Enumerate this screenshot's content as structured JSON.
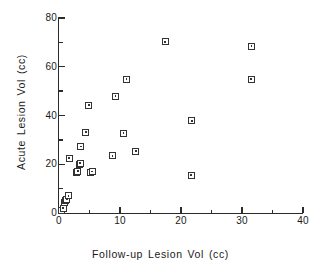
{
  "chart_data": {
    "type": "scatter",
    "title": "",
    "xlabel": "Follow-up Lesion Vol (cc)",
    "ylabel": "Acute Lesion Vol (cc)",
    "xlim": [
      0,
      40
    ],
    "ylim": [
      0,
      80
    ],
    "xticks": [
      0,
      10,
      20,
      30,
      40
    ],
    "xticklabels": [
      "0",
      "10",
      "20",
      "30",
      "40"
    ],
    "xminorticks": [
      5,
      15,
      25,
      35
    ],
    "yticks": [
      0,
      20,
      40,
      60,
      80
    ],
    "yticklabels": [
      "0",
      "20",
      "40",
      "60",
      "80"
    ],
    "yminorticks": [
      10,
      30,
      50,
      70
    ],
    "grid": false,
    "legend": false,
    "marker": "open-square-with-center-dot",
    "marker_color": "#333333",
    "series": [
      {
        "name": "Lesion volume pairs",
        "points": [
          [
            0.4,
            1.2
          ],
          [
            0.7,
            2.0
          ],
          [
            0.9,
            4.2
          ],
          [
            1.1,
            5.0
          ],
          [
            1.3,
            5.6
          ],
          [
            1.6,
            7.0
          ],
          [
            1.7,
            22.5
          ],
          [
            2.9,
            16.8
          ],
          [
            3.1,
            17.0
          ],
          [
            3.3,
            20.0
          ],
          [
            3.5,
            20.4
          ],
          [
            3.6,
            27.2
          ],
          [
            4.4,
            33.2
          ],
          [
            4.9,
            44.3
          ],
          [
            5.2,
            16.8
          ],
          [
            5.5,
            16.9
          ],
          [
            8.8,
            23.4
          ],
          [
            9.3,
            47.9
          ],
          [
            10.6,
            32.7
          ],
          [
            11.1,
            54.8
          ],
          [
            12.6,
            25.2
          ],
          [
            17.4,
            70.2
          ],
          [
            21.7,
            15.5
          ],
          [
            21.8,
            37.8
          ],
          [
            31.5,
            54.8
          ],
          [
            31.6,
            68.3
          ]
        ]
      }
    ]
  }
}
